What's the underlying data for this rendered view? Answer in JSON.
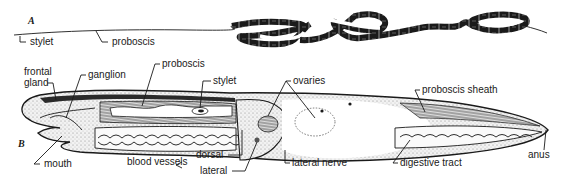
{
  "figure_a": {
    "letter": "A",
    "labels": {
      "stylet": "stylet",
      "proboscis": "proboscis"
    }
  },
  "figure_b": {
    "letter": "B",
    "labels": {
      "frontal_gland_1": "frontal",
      "frontal_gland_2": "gland",
      "ganglion": "ganglion",
      "proboscis": "proboscis",
      "stylet": "stylet",
      "ovaries": "ovaries",
      "proboscis_sheath": "proboscis sheath",
      "mouth": "mouth",
      "blood_vessels": "blood vessels",
      "dorsal": "dorsal",
      "lateral": "lateral",
      "lateral_nerve": "lateral nerve",
      "digestive_tract": "digestive tract",
      "anus": "anus"
    }
  },
  "colors": {
    "ink": "#1a1a1a",
    "paper": "#ffffff",
    "stipple": "#bdbdbd"
  }
}
